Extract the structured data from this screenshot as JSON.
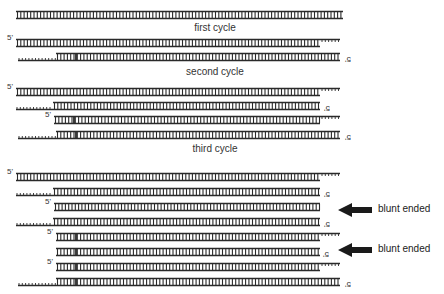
{
  "colors": {
    "strand": "#2a2a2a",
    "background": "#ffffff",
    "text": "#333333"
  },
  "captions": [
    {
      "text": "first cycle",
      "x": 215,
      "y": 22
    },
    {
      "text": "second cycle",
      "x": 215,
      "y": 66
    },
    {
      "text": "third cycle",
      "x": 215,
      "y": 143
    }
  ],
  "end_label": "5'",
  "arrow_labels": [
    {
      "text": "blunt ended",
      "x": 378,
      "y": 203
    },
    {
      "text": "blunt ended",
      "x": 378,
      "y": 243
    }
  ],
  "arrows": [
    {
      "x": 338,
      "y": 210
    },
    {
      "x": 338,
      "y": 250
    }
  ],
  "duplexes": [
    {
      "y": 15,
      "top": [
        16,
        343
      ],
      "bottom": [
        16,
        343
      ],
      "rungs": [
        16,
        343
      ],
      "label_top": null,
      "label_bottom": null
    },
    {
      "y": 43,
      "top": [
        16,
        340
      ],
      "bottom": [
        16,
        320
      ],
      "rungs": [
        16,
        320
      ],
      "top_ticks": [
        320,
        340
      ],
      "label_top": 8,
      "label_bottom": null
    },
    {
      "y": 57,
      "top": [
        56,
        340
      ],
      "bottom": [
        18,
        340
      ],
      "rungs": [
        56,
        340
      ],
      "bottom_ticks": [
        18,
        56
      ],
      "primer_mark": 76,
      "label_top": null,
      "label_bottom": 345
    },
    {
      "y": 92,
      "top": [
        16,
        340
      ],
      "bottom": [
        16,
        320
      ],
      "rungs": [
        16,
        320
      ],
      "top_ticks": [
        320,
        340
      ],
      "label_top": 8,
      "label_bottom": null
    },
    {
      "y": 106,
      "top": [
        53,
        320
      ],
      "bottom": [
        16,
        320
      ],
      "rungs": [
        53,
        320
      ],
      "bottom_ticks": [
        16,
        53
      ],
      "label_top": null,
      "label_bottom": 324
    },
    {
      "y": 120,
      "top": [
        54,
        340
      ],
      "bottom": [
        54,
        320
      ],
      "rungs": [
        54,
        320
      ],
      "top_ticks": [
        320,
        340
      ],
      "primer_mark": 74,
      "label_top": 46,
      "label_bottom": null
    },
    {
      "y": 135,
      "top": [
        56,
        340
      ],
      "bottom": [
        18,
        340
      ],
      "rungs": [
        56,
        340
      ],
      "bottom_ticks": [
        18,
        56
      ],
      "primer_mark": 76,
      "label_top": null,
      "label_bottom": 345
    },
    {
      "y": 177,
      "top": [
        16,
        340
      ],
      "bottom": [
        16,
        320
      ],
      "rungs": [
        16,
        320
      ],
      "top_ticks": [
        320,
        340
      ],
      "label_top": 8,
      "label_bottom": null
    },
    {
      "y": 192,
      "top": [
        53,
        320
      ],
      "bottom": [
        16,
        320
      ],
      "rungs": [
        53,
        320
      ],
      "bottom_ticks": [
        16,
        53
      ],
      "label_top": null,
      "label_bottom": 324
    },
    {
      "y": 207,
      "top": [
        54,
        320
      ],
      "bottom": [
        54,
        320
      ],
      "rungs": [
        54,
        320
      ],
      "label_top": 46,
      "label_bottom": null
    },
    {
      "y": 222,
      "top": [
        53,
        320
      ],
      "bottom": [
        16,
        320
      ],
      "rungs": [
        53,
        320
      ],
      "bottom_ticks": [
        16,
        53
      ],
      "label_top": null,
      "label_bottom": 324
    },
    {
      "y": 237,
      "top": [
        56,
        340
      ],
      "bottom": [
        56,
        320
      ],
      "rungs": [
        56,
        320
      ],
      "top_ticks": [
        320,
        340
      ],
      "primer_mark": 76,
      "label_top": 48,
      "label_bottom": null
    },
    {
      "y": 252,
      "top": [
        56,
        320
      ],
      "bottom": [
        56,
        320
      ],
      "rungs": [
        56,
        320
      ],
      "primer_mark": 76,
      "label_top": null,
      "label_bottom": 323
    },
    {
      "y": 267,
      "top": [
        56,
        340
      ],
      "bottom": [
        56,
        320
      ],
      "rungs": [
        56,
        320
      ],
      "top_ticks": [
        320,
        340
      ],
      "primer_mark": 76,
      "label_top": 48,
      "label_bottom": null
    },
    {
      "y": 282,
      "top": [
        56,
        340
      ],
      "bottom": [
        18,
        340
      ],
      "rungs": [
        56,
        340
      ],
      "bottom_ticks": [
        18,
        56
      ],
      "primer_mark": 76,
      "label_top": null,
      "label_bottom": 345
    }
  ]
}
